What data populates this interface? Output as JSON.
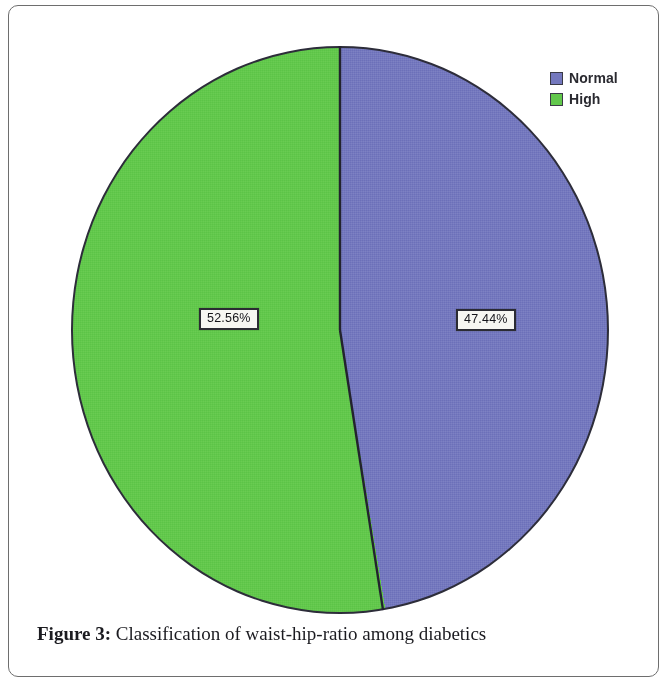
{
  "figure": {
    "caption_label": "Figure 3:",
    "caption_text": " Classification of waist-hip-ratio among diabetics"
  },
  "legend": {
    "items": [
      {
        "label": "Normal",
        "color": "#7478be",
        "swatch_name": "legend-swatch-normal"
      },
      {
        "label": "High",
        "color": "#62c84c",
        "swatch_name": "legend-swatch-high"
      }
    ]
  },
  "labels": {
    "high": "52.56%",
    "normal": "47.44%"
  },
  "colors": {
    "normal": "#7478be",
    "high": "#62c84c",
    "outline": "#2d2d3a",
    "frame": "#6e6e6e",
    "label_box_bg": "#f6f6f2",
    "label_box_border": "#2b2b33",
    "text": "#1b1b20"
  },
  "chart_data": {
    "type": "pie",
    "title": "",
    "categories": [
      "Normal",
      "High"
    ],
    "values": [
      47.44,
      52.56
    ],
    "value_labels": [
      "47.44%",
      "52.56%"
    ],
    "unit": "%",
    "colors": [
      "#7478be",
      "#62c84c"
    ],
    "legend": [
      "Normal",
      "High"
    ],
    "legend_position": "top-right",
    "start_angle_deg": 0,
    "direction": "clockwise",
    "grid": false,
    "xlabel": "",
    "ylabel": "",
    "annotations": [
      "52.56%",
      "47.44%"
    ]
  }
}
